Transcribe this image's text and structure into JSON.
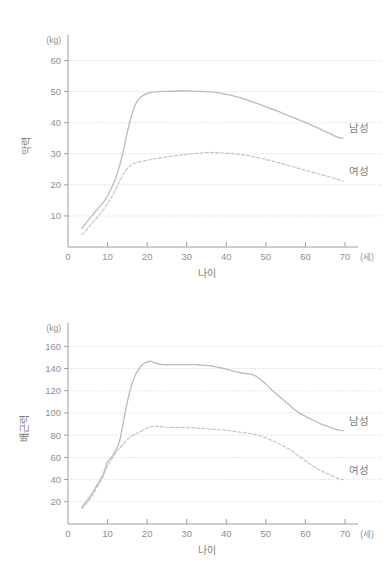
{
  "chart_data": [
    {
      "id": "grip-strength",
      "type": "line",
      "title": "",
      "xlabel": "나이",
      "ylabel": "악력",
      "x_unit": "(세)",
      "y_unit": "(kg)",
      "xlim": [
        0,
        70
      ],
      "ylim": [
        0,
        65
      ],
      "xticks": [
        "0",
        "10",
        "20",
        "30",
        "40",
        "50",
        "60",
        "70"
      ],
      "xtick_values": [
        0,
        10,
        20,
        30,
        40,
        50,
        60,
        70
      ],
      "yticks": [
        "10",
        "20",
        "30",
        "40",
        "50",
        "60"
      ],
      "ytick_values": [
        10,
        20,
        30,
        40,
        50,
        60
      ],
      "grid": true,
      "legend_position": "inline-right",
      "series": [
        {
          "name": "남성",
          "style": "solid",
          "color": "#bdbdbd",
          "x": [
            3.5,
            5,
            6,
            7,
            8,
            9,
            10,
            11,
            12,
            13,
            14,
            15,
            16,
            17,
            18,
            19,
            20,
            22,
            25,
            28,
            30,
            33,
            35,
            38,
            40,
            43,
            45,
            48,
            50,
            53,
            55,
            58,
            60,
            62,
            64,
            66,
            68,
            69.5
          ],
          "y": [
            6,
            8.5,
            10,
            11.5,
            13,
            14.5,
            16.5,
            19,
            22,
            26,
            31,
            37,
            42,
            45.8,
            47.8,
            48.8,
            49.4,
            49.9,
            50.1,
            50.2,
            50.2,
            50.1,
            50,
            49.6,
            49.1,
            48.2,
            47.4,
            46.1,
            45.1,
            43.7,
            42.6,
            41.1,
            40.1,
            39,
            37.8,
            36.6,
            35.4,
            35
          ]
        },
        {
          "name": "여성",
          "style": "dashed",
          "color": "#c4c4c4",
          "x": [
            3.5,
            5,
            6,
            7,
            8,
            9,
            10,
            11,
            12,
            13,
            14,
            15,
            16,
            17,
            18,
            20,
            22,
            25,
            28,
            30,
            33,
            35,
            37,
            40,
            42,
            45,
            47,
            50,
            53,
            55,
            58,
            60,
            62,
            64,
            66,
            68,
            69.5
          ],
          "y": [
            4,
            6,
            7.5,
            9,
            10.5,
            12,
            14,
            16,
            18.5,
            21,
            23.5,
            25.3,
            26.4,
            27,
            27.4,
            27.9,
            28.4,
            29,
            29.5,
            29.8,
            30.2,
            30.4,
            30.4,
            30.2,
            30,
            29.5,
            29,
            28.2,
            27.2,
            26.5,
            25.4,
            24.7,
            24,
            23.3,
            22.6,
            21.8,
            21.2
          ]
        }
      ]
    },
    {
      "id": "back-strength",
      "type": "line",
      "title": "",
      "xlabel": "나이",
      "ylabel": "배근력",
      "x_unit": "(세)",
      "y_unit": "(kg)",
      "xlim": [
        0,
        70
      ],
      "ylim": [
        0,
        172
      ],
      "xticks": [
        "0",
        "10",
        "20",
        "30",
        "40",
        "50",
        "60",
        "70"
      ],
      "xtick_values": [
        0,
        10,
        20,
        30,
        40,
        50,
        60,
        70
      ],
      "yticks": [
        "20",
        "40",
        "60",
        "80",
        "100",
        "120",
        "140",
        "160"
      ],
      "ytick_values": [
        20,
        40,
        60,
        80,
        100,
        120,
        140,
        160
      ],
      "grid": true,
      "legend_position": "inline-right",
      "series": [
        {
          "name": "남성",
          "style": "solid",
          "color": "#bdbdbd",
          "x": [
            3.5,
            5,
            6,
            7,
            8,
            9,
            10,
            11,
            12,
            13,
            14,
            15,
            16,
            17,
            18,
            19,
            20,
            21,
            22,
            24,
            26,
            28,
            30,
            32,
            34,
            36,
            38,
            40,
            42,
            44,
            45,
            46,
            47,
            48,
            50,
            52,
            54,
            56,
            58,
            60,
            62,
            64,
            66,
            68,
            69.5
          ],
          "y": [
            15,
            22,
            27,
            33,
            39,
            46,
            56,
            60,
            66,
            74,
            92,
            110,
            124,
            134,
            140,
            144,
            146,
            146.5,
            145,
            143.5,
            143.5,
            143.5,
            143.5,
            143.5,
            143,
            142.5,
            141,
            139.5,
            137.5,
            136,
            135.5,
            135,
            134,
            132,
            126,
            119,
            113,
            107,
            101,
            97,
            93.5,
            90,
            87.5,
            85,
            84
          ]
        },
        {
          "name": "여성",
          "style": "dashed",
          "color": "#c4c4c4",
          "x": [
            3.5,
            5,
            6,
            7,
            8,
            9,
            10,
            11,
            12,
            13,
            14,
            15,
            16,
            17,
            18,
            19,
            20,
            21,
            22,
            24,
            26,
            28,
            30,
            32,
            34,
            36,
            38,
            40,
            42,
            44,
            46,
            48,
            50,
            52,
            54,
            56,
            58,
            60,
            62,
            64,
            66,
            68,
            69.5
          ],
          "y": [
            14,
            20,
            25,
            31,
            37,
            44,
            52,
            58,
            64,
            68,
            72,
            76,
            79,
            81,
            82.5,
            84.5,
            86.5,
            87.5,
            88,
            87.5,
            87,
            87,
            86.8,
            86.5,
            86,
            85.5,
            85,
            84.5,
            83.5,
            82.5,
            81.5,
            80,
            77.5,
            74.5,
            71,
            67,
            62,
            57,
            52,
            48,
            44.5,
            41.5,
            40
          ]
        }
      ]
    }
  ]
}
